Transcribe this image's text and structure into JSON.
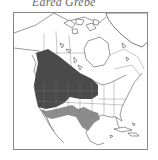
{
  "title": "Eared Grebe",
  "map": {
    "region": "North America",
    "legend_colors": {
      "breeding_range": "#4a4a4a",
      "winter_range": "#8c8c8c",
      "background": "#ffffff",
      "borders": "#555555"
    },
    "ranges": [
      {
        "name": "breeding",
        "description": "Western Canada and western United States",
        "color": "#4a4a4a"
      },
      {
        "name": "winter",
        "description": "Southwestern United States, Texas, and Mexico",
        "color": "#8c8c8c"
      }
    ]
  }
}
